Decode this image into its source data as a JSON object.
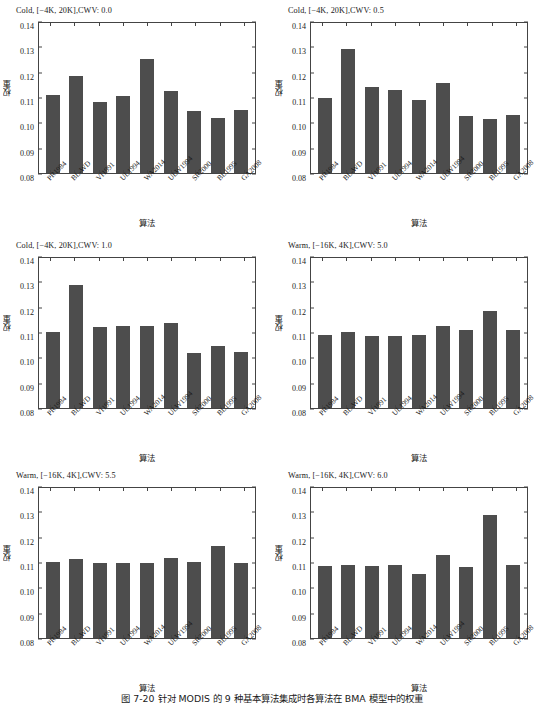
{
  "figure": {
    "caption": "图 7-20  针对 MODIS 的 9 种基本算法集成时各算法在 BMA 模型中的权重",
    "bar_color": "#4d4d4d",
    "axis_color": "#444444"
  },
  "axis": {
    "xlabel": "算法",
    "ylabel": "权重",
    "yticks": [
      "0.08",
      "0.09",
      "0.10",
      "0.11",
      "0.12",
      "0.13",
      "0.14"
    ],
    "ymin": 0.08,
    "ymax": 0.14
  },
  "chart_data": [
    {
      "type": "bar",
      "title": "Cold, [−4K, 20K],CWV: 0.0",
      "xlabel": "算法",
      "ylabel": "权重",
      "ylim": [
        0.08,
        0.14
      ],
      "grid": false,
      "categories": [
        "PR1984",
        "BL-WD",
        "VI1991",
        "UL1994",
        "WA2014",
        "ULW1994",
        "SR2000",
        "BL1995",
        "GA2008"
      ],
      "values": [
        0.1113,
        0.1188,
        0.1085,
        0.111,
        0.1255,
        0.1128,
        0.1048,
        0.1022,
        0.1051
      ]
    },
    {
      "type": "bar",
      "title": "Cold, [−4K, 20K],CWV: 0.5",
      "xlabel": "算法",
      "ylabel": "权重",
      "ylim": [
        0.08,
        0.14
      ],
      "grid": false,
      "categories": [
        "PR1984",
        "BL-WD",
        "VI1991",
        "UL1994",
        "WA2014",
        "ULW1994",
        "SR2000",
        "BL1995",
        "GA2008"
      ],
      "values": [
        0.1102,
        0.1298,
        0.1144,
        0.1132,
        0.1094,
        0.1162,
        0.1029,
        0.1018,
        0.1031
      ]
    },
    {
      "type": "bar",
      "title": "Cold, [−4K, 20K],CWV: 1.0",
      "xlabel": "算法",
      "ylabel": "权重",
      "ylim": [
        0.08,
        0.14
      ],
      "grid": false,
      "categories": [
        "PR1984",
        "BL-WD",
        "VI1991",
        "UL1994",
        "WA2014",
        "ULW1994",
        "SR2000",
        "BL1995",
        "GA2008"
      ],
      "values": [
        0.1104,
        0.1293,
        0.1126,
        0.1129,
        0.1127,
        0.1139,
        0.102,
        0.1049,
        0.1024
      ]
    },
    {
      "type": "bar",
      "title": "Warm, [−16K, 4K],CWV: 5.0",
      "xlabel": "算法",
      "ylabel": "权重",
      "ylim": [
        0.08,
        0.14
      ],
      "grid": false,
      "categories": [
        "PR1984",
        "BL-WD",
        "VI1991",
        "UL1994",
        "WA2014",
        "ULW1994",
        "SR2000",
        "BL1995",
        "GA2008"
      ],
      "values": [
        0.1093,
        0.1106,
        0.109,
        0.1088,
        0.1093,
        0.1128,
        0.1113,
        0.1189,
        0.1112
      ]
    },
    {
      "type": "bar",
      "title": "Warm, [−16K, 4K],CWV: 5.5",
      "xlabel": "算法",
      "ylabel": "权重",
      "ylim": [
        0.08,
        0.14
      ],
      "grid": false,
      "categories": [
        "PR1984",
        "BL-WD",
        "VI1991",
        "UL1994",
        "WA2014",
        "ULW1994",
        "SR2000",
        "BL1995",
        "GA2008"
      ],
      "values": [
        0.1104,
        0.1117,
        0.11,
        0.11,
        0.11,
        0.1122,
        0.1103,
        0.1169,
        0.1101
      ]
    },
    {
      "type": "bar",
      "title": "Warm, [−16K, 4K],CWV: 6.0",
      "xlabel": "算法",
      "ylabel": "权重",
      "ylim": [
        0.08,
        0.14
      ],
      "grid": false,
      "categories": [
        "PR1984",
        "BL-WD",
        "VI1991",
        "UL1994",
        "WA2014",
        "ULW1994",
        "SR2000",
        "BL1995",
        "GA2008"
      ],
      "values": [
        0.109,
        0.1092,
        0.1089,
        0.1091,
        0.1056,
        0.1134,
        0.1083,
        0.1294,
        0.1091
      ]
    }
  ]
}
